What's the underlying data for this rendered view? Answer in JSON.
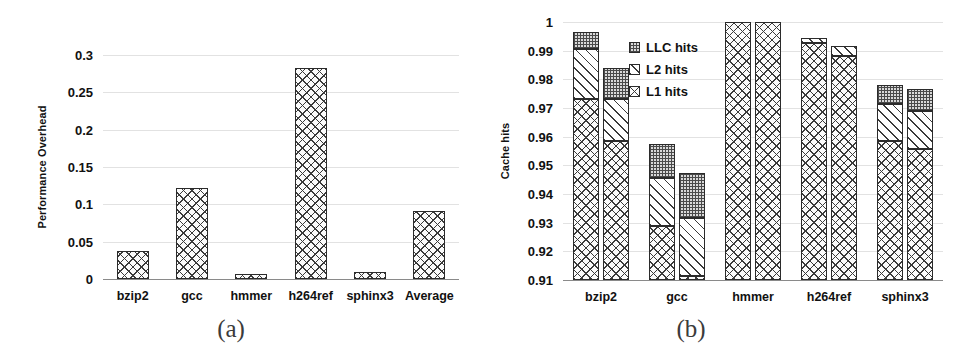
{
  "figure": {
    "panel_a_caption": "(a)",
    "panel_b_caption": "(b)"
  },
  "chart_data": [
    {
      "id": "performance-overhead",
      "type": "bar",
      "title": "",
      "xlabel": "",
      "ylabel": "Performance Overhead",
      "ylim": [
        0,
        0.3
      ],
      "yticks": [
        "0",
        "0.05",
        "0.1",
        "0.15",
        "0.2",
        "0.25",
        "0.3"
      ],
      "ytick_values": [
        0,
        0.05,
        0.1,
        0.15,
        0.2,
        0.25,
        0.3
      ],
      "grid": true,
      "legend": "none",
      "categories": [
        "bzip2",
        "gcc",
        "hmmer",
        "h264ref",
        "sphinx3",
        "Average"
      ],
      "values": [
        0.037,
        0.122,
        0.007,
        0.282,
        0.009,
        0.091
      ]
    },
    {
      "id": "cache-hits",
      "type": "bar",
      "subtype": "stacked-grouped",
      "title": "",
      "xlabel": "",
      "ylabel": "Cache hits",
      "ylim": [
        0.91,
        1
      ],
      "yticks": [
        "0.91",
        "0.92",
        "0.93",
        "0.94",
        "0.95",
        "0.96",
        "0.97",
        "0.98",
        "0.99",
        "1"
      ],
      "ytick_values": [
        0.91,
        0.92,
        0.93,
        0.94,
        0.95,
        0.96,
        0.97,
        0.98,
        0.99,
        1
      ],
      "grid": true,
      "legend_position": "upper-left-inside",
      "categories": [
        "bzip2",
        "gcc",
        "hmmer",
        "h264ref",
        "sphinx3"
      ],
      "series": [
        {
          "name": "L1 hits",
          "pattern": "crosshatch",
          "bar1": [
            0.973,
            0.929,
            1.0,
            0.9925,
            0.9585
          ],
          "bar2": [
            0.9585,
            0.9115,
            1.0,
            0.988,
            0.9558
          ]
        },
        {
          "name": "L2 hits",
          "pattern": "diagonal",
          "bar1": [
            0.9905,
            0.9455,
            1.0,
            0.9945,
            0.9715
          ],
          "bar2": [
            0.973,
            0.9318,
            1.0,
            0.9915,
            0.969
          ]
        },
        {
          "name": "LLC hits",
          "pattern": "dotted",
          "bar1": [
            0.9965,
            0.9575,
            1.0,
            0.9945,
            0.978
          ],
          "bar2": [
            0.984,
            0.9472,
            1.0,
            0.9915,
            0.9765
          ]
        }
      ],
      "legend_entries": [
        "LLC hits",
        "L2 hits",
        "L1 hits"
      ]
    }
  ],
  "colors": {
    "gridline": "#e2e2e2",
    "axis": "#8a8a8a",
    "bar_outline": "#2b2b2b",
    "text": "#111111",
    "caption": "#3b3b3b",
    "background": "#ffffff"
  }
}
